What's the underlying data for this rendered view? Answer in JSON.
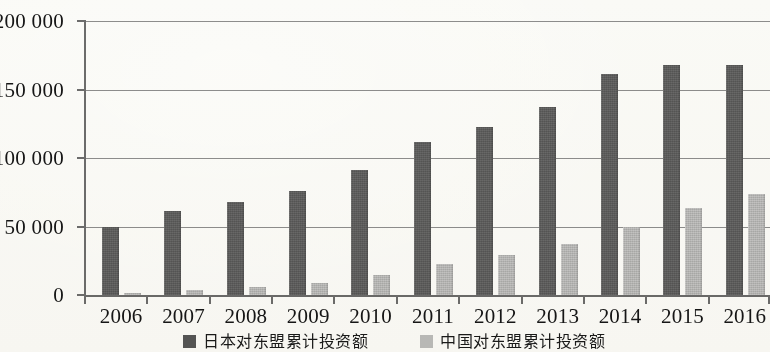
{
  "chart_data": {
    "type": "bar",
    "title": "",
    "subtitle": "",
    "xlabel": "",
    "ylabel": "",
    "categories": [
      "2006",
      "2007",
      "2008",
      "2009",
      "2010",
      "2011",
      "2012",
      "2013",
      "2014",
      "2015",
      "2016"
    ],
    "series": [
      {
        "name": "日本对东盟累计投资额",
        "color": "#5b5b5b",
        "values": [
          50000,
          61500,
          68000,
          76000,
          91500,
          111500,
          123000,
          137500,
          161000,
          168000,
          168000
        ]
      },
      {
        "name": "中国对东盟累计投资额",
        "color": "#b9b9b9",
        "values": [
          1500,
          4000,
          6000,
          9000,
          14500,
          22500,
          29000,
          37000,
          49500,
          63500,
          73500
        ]
      }
    ],
    "ylim": [
      0,
      200000
    ],
    "ytick_values": [
      0,
      50000,
      100000,
      150000,
      200000
    ],
    "ytick_labels": [
      "0",
      "50 000",
      "100 000",
      "150 000",
      "200 000"
    ],
    "grid": true,
    "grid_axis": "y",
    "legend_position": "bottom",
    "bar_group_count": 11,
    "series_count": 2
  },
  "legend": {
    "items": [
      {
        "label": "日本对东盟累计投资额",
        "swatch": "dark-gray-swatch"
      },
      {
        "label": "中国对东盟累计投资额",
        "swatch": "light-gray-swatch"
      }
    ]
  }
}
